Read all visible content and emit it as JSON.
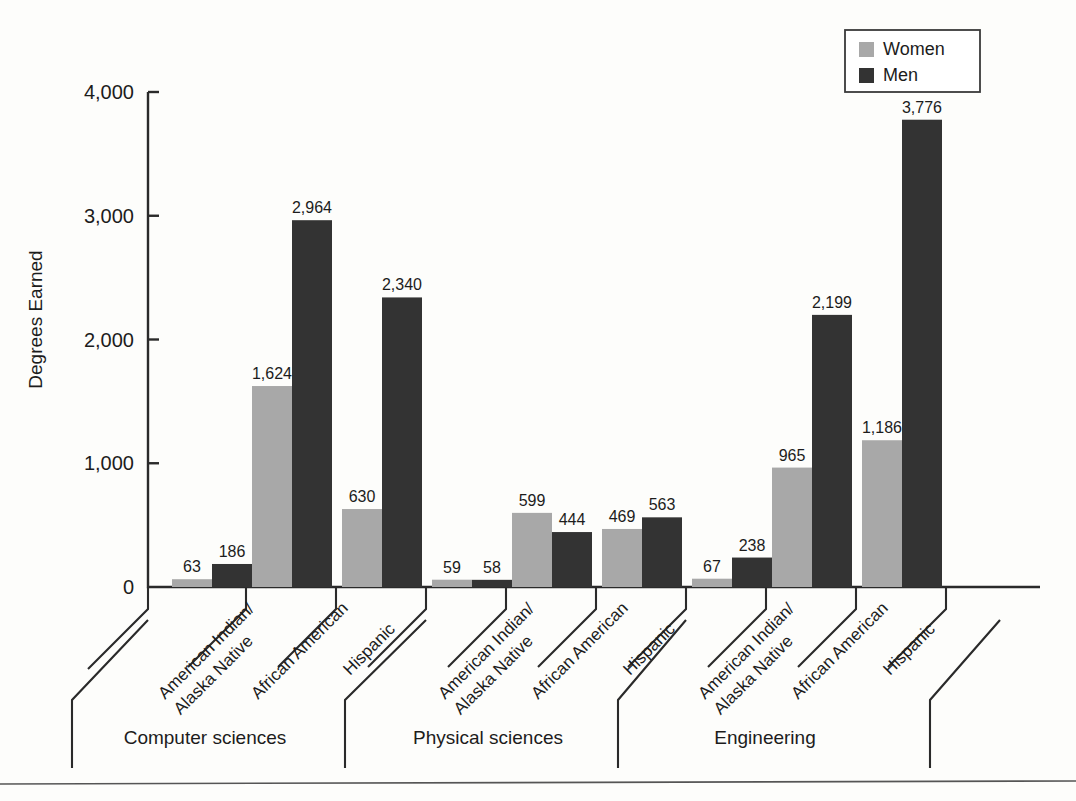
{
  "chart_data": {
    "type": "bar",
    "title": "",
    "xlabel": "",
    "ylabel": "Degrees Earned",
    "ylim": [
      0,
      4000
    ],
    "ytick_labels": [
      "0",
      "1,000",
      "2,000",
      "3,000",
      "4,000"
    ],
    "ytick_values": [
      0,
      1000,
      2000,
      3000,
      4000
    ],
    "grid": false,
    "legend_position": "top-right",
    "legend": [
      "Women",
      "Men"
    ],
    "series": [
      {
        "name": "Women",
        "color": "#a8a8a8",
        "values": [
          63,
          1624,
          630,
          59,
          599,
          469,
          67,
          965,
          1186
        ]
      },
      {
        "name": "Men",
        "color": "#333333",
        "values": [
          186,
          2964,
          2340,
          58,
          444,
          563,
          238,
          2199,
          3776
        ]
      }
    ],
    "categories": [
      "American Indian/\nAlaska Native",
      "African American",
      "Hispanic",
      "American Indian/\nAlaska Native",
      "African American",
      "Hispanic",
      "American Indian/\nAlaska Native",
      "African American",
      "Hispanic"
    ],
    "category_lines": [
      [
        "American Indian/",
        "Alaska Native"
      ],
      [
        "African American"
      ],
      [
        "Hispanic"
      ],
      [
        "American Indian/",
        "Alaska Native"
      ],
      [
        "African American"
      ],
      [
        "Hispanic"
      ],
      [
        "American Indian/",
        "Alaska Native"
      ],
      [
        "African American"
      ],
      [
        "Hispanic"
      ]
    ],
    "groups": [
      {
        "label": "Computer sciences",
        "category_span": [
          0,
          2
        ]
      },
      {
        "label": "Physical sciences",
        "category_span": [
          3,
          5
        ]
      },
      {
        "label": "Engineering",
        "category_span": [
          6,
          8
        ]
      }
    ],
    "value_labels": [
      "63",
      "186",
      "1,624",
      "2,964",
      "630",
      "2,340",
      "59",
      "58",
      "599",
      "444",
      "469",
      "563",
      "67",
      "238",
      "965",
      "2,199",
      "1,186",
      "3,776"
    ],
    "colors": {
      "women": "#a8a8a8",
      "men": "#333333",
      "axis": "#2a2a2a",
      "background": "#fdfdfb"
    }
  }
}
